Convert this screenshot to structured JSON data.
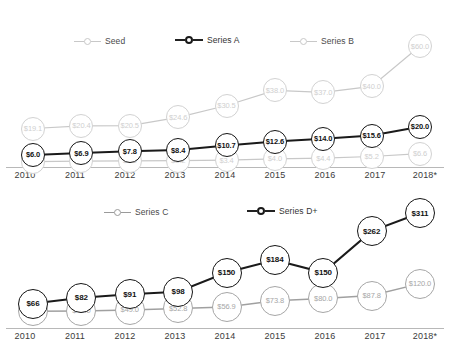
{
  "chart_data": [
    {
      "type": "line",
      "title": "",
      "xlabel": "",
      "ylabel": "",
      "grid": false,
      "legend_position": "top",
      "categories": [
        "2010",
        "2011",
        "2012",
        "2013",
        "2014",
        "2015",
        "2016",
        "2017",
        "2018*"
      ],
      "ylim": [
        0,
        65
      ],
      "series": [
        {
          "name": "Seed",
          "color": "#d2d2d2",
          "style": "faint",
          "values": [
            2.7,
            2.9,
            3.0,
            3.2,
            3.4,
            4.0,
            4.4,
            5.2,
            6.6
          ],
          "labels": [
            "$2.7",
            "$2.9",
            "$3.0",
            "$3.2",
            "$3.4",
            "$4.0",
            "$4.4",
            "$5.2",
            "$6.6"
          ]
        },
        {
          "name": "Series A",
          "color": "#141414",
          "style": "dark",
          "values": [
            6.0,
            6.9,
            7.8,
            8.4,
            10.7,
            12.6,
            14.0,
            15.6,
            20.0
          ],
          "labels": [
            "$6.0",
            "$6.9",
            "$7.8",
            "$8.4",
            "$10.7",
            "$12.6",
            "$14.0",
            "$15.6",
            "$20.0"
          ]
        },
        {
          "name": "Series B",
          "color": "#c8c8c8",
          "style": "faint",
          "values": [
            19.1,
            20.4,
            20.5,
            24.6,
            30.5,
            38.0,
            37.0,
            40.0,
            60.0
          ],
          "labels": [
            "$19.1",
            "$20.4",
            "$20.5",
            "$24.6",
            "$30.5",
            "$38.0",
            "$37.0",
            "$40.0",
            "$60.0"
          ]
        }
      ]
    },
    {
      "type": "line",
      "title": "",
      "xlabel": "",
      "ylabel": "",
      "grid": false,
      "legend_position": "top",
      "categories": [
        "2010",
        "2011",
        "2012",
        "2013",
        "2014",
        "2015",
        "2016",
        "2017",
        "2018*"
      ],
      "ylim": [
        0,
        330
      ],
      "series": [
        {
          "name": "Series C",
          "color": "#a6a6a6",
          "style": "mid",
          "values": [
            45.0,
            46.0,
            49.0,
            52.8,
            56.9,
            73.8,
            80.0,
            87.8,
            120.0
          ],
          "labels": [
            "$45.0",
            "$46.0",
            "$49.0",
            "$52.8",
            "$56.9",
            "$73.8",
            "$80.0",
            "$87.8",
            "$120.0"
          ]
        },
        {
          "name": "Series D+",
          "color": "#141414",
          "style": "dark",
          "values": [
            66,
            82,
            91,
            98,
            150,
            184,
            150,
            262,
            311
          ],
          "labels": [
            "$66",
            "$82",
            "$91",
            "$98",
            "$150",
            "$184",
            "$150",
            "$262",
            "$311"
          ]
        }
      ]
    }
  ],
  "top_chart": {
    "legend": [
      {
        "label": "Seed",
        "style": "faint"
      },
      {
        "label": "Series A",
        "style": "dark"
      },
      {
        "label": "Series B",
        "style": "faint"
      }
    ]
  },
  "bottom_chart": {
    "legend": [
      {
        "label": "Series C",
        "style": "mid"
      },
      {
        "label": "Series D+",
        "style": "dark"
      }
    ]
  }
}
